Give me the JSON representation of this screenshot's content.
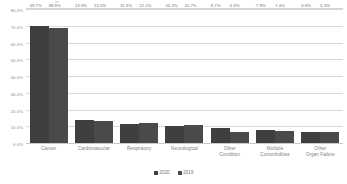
{
  "chart_data": {
    "type": "bar",
    "title": "",
    "xlabel": "",
    "ylabel": "",
    "ylim": [
      0,
      80
    ],
    "ytick_labels": [
      "80.0%",
      "70.0%",
      "60.0%",
      "50.0%",
      "40.0%",
      "30.0%",
      "20.0%",
      "10.0%",
      "0.0%"
    ],
    "ytick_values": [
      80,
      70,
      60,
      50,
      40,
      30,
      20,
      10,
      0
    ],
    "grid": true,
    "legend_position": "bottom-center",
    "categories": [
      "Cancer",
      "Cardiovascular",
      "Respiratory",
      "Neurological",
      "Other Condition",
      "Multiple Comorbidities",
      "Other Organ Failure"
    ],
    "series": [
      {
        "name": "2020",
        "color": "#3f3f3f",
        "values": [
          69.7,
          13.9,
          11.3,
          10.2,
          8.7,
          7.8,
          6.6
        ],
        "labels": [
          "69.7%",
          "13.9%",
          "11.3%",
          "10.2%",
          "8.7%",
          "7.8%",
          "6.6%"
        ]
      },
      {
        "name": "2019",
        "color": "#4a4a4a",
        "values": [
          68.9,
          13.0,
          12.1,
          10.7,
          6.3,
          7.4,
          6.3
        ],
        "labels": [
          "68.9%",
          "13.0%",
          "12.1%",
          "10.7%",
          "6.3%",
          "7.4%",
          "6.3%"
        ]
      }
    ]
  },
  "legend": {
    "items": [
      {
        "label": "2020",
        "color": "#3f3f3f"
      },
      {
        "label": "2019",
        "color": "#4a4a4a"
      }
    ]
  },
  "category_lines": [
    [
      "Cancer"
    ],
    [
      "Cardiovascular"
    ],
    [
      "Respiratory"
    ],
    [
      "Neurological"
    ],
    [
      "Other",
      "Condition"
    ],
    [
      "Multiple",
      "Comorbidities"
    ],
    [
      "Other",
      "Organ Failure"
    ]
  ]
}
